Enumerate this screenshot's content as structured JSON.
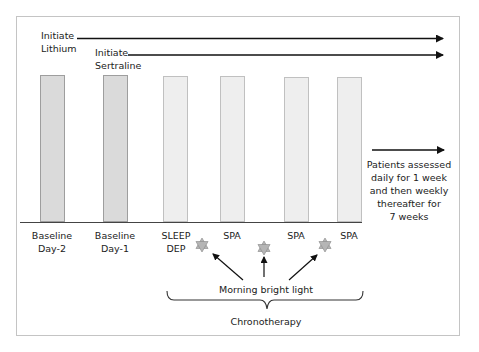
{
  "diagram": {
    "medications": [
      {
        "line1": "Initiate",
        "line2": "Lithium"
      },
      {
        "line1": "Initiate",
        "line2": "Sertraline"
      }
    ],
    "timepoints": [
      {
        "line1": "Baseline",
        "line2": "Day-2",
        "shade": "baseline"
      },
      {
        "line1": "Baseline",
        "line2": "Day-1",
        "shade": "baseline"
      },
      {
        "line1": "SLEEP",
        "line2": "DEP",
        "shade": "treatment"
      },
      {
        "line1": "SPA",
        "line2": "",
        "shade": "treatment"
      },
      {
        "line1": "SPA",
        "line2": "",
        "shade": "treatment"
      },
      {
        "line1": "SPA",
        "line2": "",
        "shade": "treatment"
      }
    ],
    "followup_note": {
      "lines": [
        "Patients assessed",
        "daily for 1 week",
        "and then weekly",
        "thereafter for",
        "7 weeks"
      ]
    },
    "light_label": "Morning bright light",
    "light_icon": "star-icon",
    "group_label": "Chronotherapy",
    "colors": {
      "baseline_bar_fill": "#dadada",
      "treatment_bar_fill": "#eeeeee",
      "star_fill": "#b5b5b5",
      "arrow": "#111111",
      "frame_border": "#c4c4c4"
    }
  }
}
